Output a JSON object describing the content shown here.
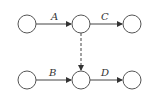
{
  "diagram": {
    "type": "network-activity-graph",
    "colors": {
      "stroke": "#444444",
      "background": "#ffffff",
      "text": "#333333"
    },
    "nodes": [
      {
        "id": "n1",
        "cx": 27,
        "cy": 24,
        "r": 9
      },
      {
        "id": "n2",
        "cx": 81,
        "cy": 24,
        "r": 9
      },
      {
        "id": "n3",
        "cx": 132,
        "cy": 24,
        "r": 9
      },
      {
        "id": "n4",
        "cx": 27,
        "cy": 80,
        "r": 9
      },
      {
        "id": "n5",
        "cx": 81,
        "cy": 80,
        "r": 9
      },
      {
        "id": "n6",
        "cx": 132,
        "cy": 80,
        "r": 9
      }
    ],
    "edges": [
      {
        "from": "n1",
        "to": "n2",
        "label": "A",
        "style": "solid"
      },
      {
        "from": "n2",
        "to": "n3",
        "label": "C",
        "style": "solid"
      },
      {
        "from": "n4",
        "to": "n5",
        "label": "B",
        "style": "solid"
      },
      {
        "from": "n5",
        "to": "n6",
        "label": "D",
        "style": "solid"
      },
      {
        "from": "n2",
        "to": "n5",
        "label": "",
        "style": "dashed"
      }
    ],
    "labels": {
      "a": "A",
      "b": "B",
      "c": "C",
      "d": "D"
    }
  }
}
